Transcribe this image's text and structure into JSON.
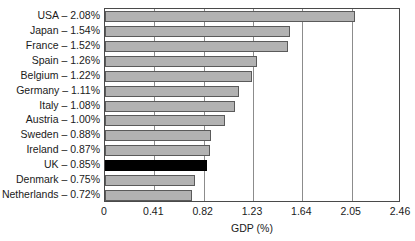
{
  "chart_data": {
    "type": "bar",
    "orientation": "horizontal",
    "title": "",
    "xlabel": "GDP (%)",
    "ylabel": "",
    "xlim": [
      0,
      2.46
    ],
    "xticks": [
      "0",
      "0.41",
      "0.82",
      "1.23",
      "1.64",
      "2.05",
      "2.46"
    ],
    "xtick_values": [
      0,
      0.41,
      0.82,
      1.23,
      1.64,
      2.05,
      2.46
    ],
    "grid": "vertical",
    "legend": "none",
    "categories": [
      "USA",
      "Japan",
      "France",
      "Spain",
      "Belgium",
      "Germany",
      "Italy",
      "Austria",
      "Sweden",
      "Ireland",
      "UK",
      "Denmark",
      "Netherlands"
    ],
    "values": [
      2.08,
      1.54,
      1.52,
      1.26,
      1.22,
      1.11,
      1.08,
      1.0,
      0.88,
      0.87,
      0.85,
      0.75,
      0.72
    ],
    "labels": [
      "USA – 2.08%",
      "Japan – 1.54%",
      "France – 1.52%",
      "Spain – 1.26%",
      "Belgium – 1.22%",
      "Germany – 1.11%",
      "Italy – 1.08%",
      "Austria – 1.00%",
      "Sweden – 0.88%",
      "Ireland – 0.87%",
      "UK – 0.85%",
      "Denmark – 0.75%",
      "Netherlands – 0.72%"
    ],
    "highlight_index": 10,
    "colors": {
      "bar": "#b2b2b2",
      "bar_edge": "#5a5a5a",
      "bar_highlight": "#000000",
      "axis": "#4a4a4a",
      "grid": "#8c8c8c",
      "text": "#1a1a1a",
      "background": "#ffffff"
    }
  }
}
